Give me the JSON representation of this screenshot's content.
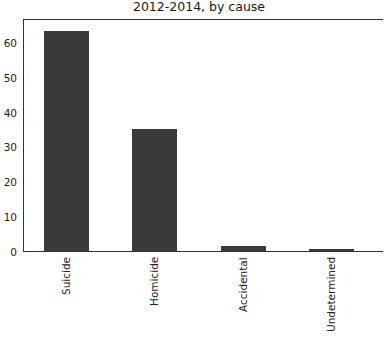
{
  "chart_data": {
    "type": "bar",
    "title": "2012-2014, by cause",
    "xlabel": "",
    "ylabel": "",
    "categories": [
      "Suicide",
      "Homicide",
      "Accidental",
      "Undetermined"
    ],
    "values": [
      63.5,
      35.3,
      1.6,
      0.8
    ],
    "ylim": [
      0,
      67
    ],
    "yticks": [
      0,
      10,
      20,
      30,
      40,
      50,
      60
    ],
    "ytick_labels": [
      "0",
      "10",
      "20",
      "30",
      "40",
      "50",
      "60"
    ],
    "grid": false,
    "legend": null,
    "bar_color": "#3a3a3a",
    "xtick_rotation": 90
  }
}
